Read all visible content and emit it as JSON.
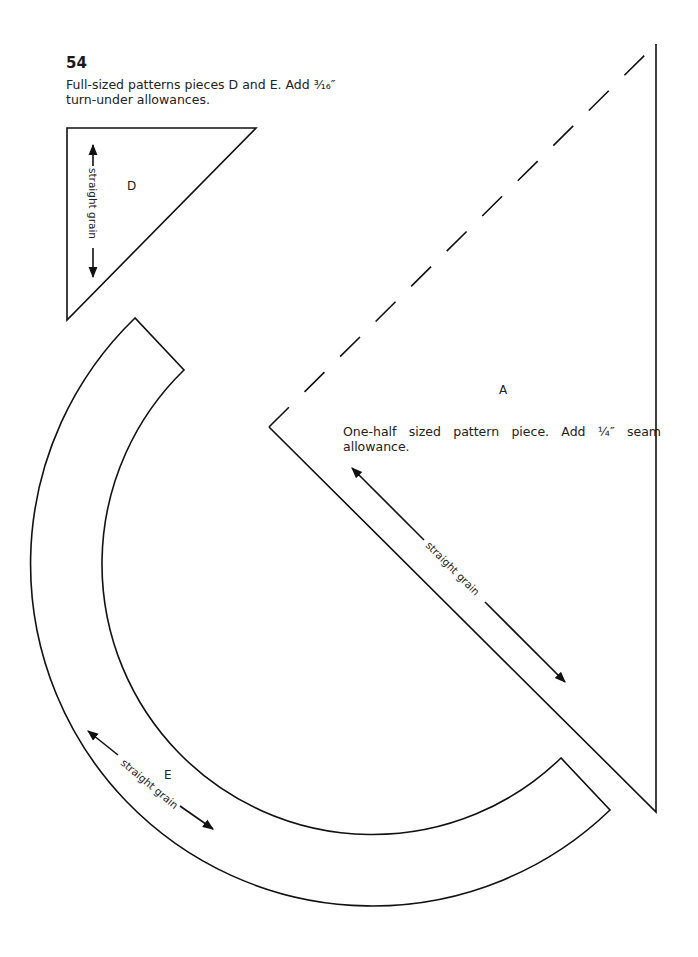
{
  "page": {
    "number": "54"
  },
  "captions": {
    "pieces_de": "Full-sized patterns pieces D and E. Add ³⁄₁₆″ turn-under allowances.",
    "piece_a": "One-half sized pattern piece. Add ¼″ seam allowance."
  },
  "pieces": {
    "d": {
      "label": "D",
      "grain_label": "straight grain"
    },
    "a": {
      "label": "A",
      "grain_label": "straight grain"
    },
    "e": {
      "label": "E",
      "grain_label": "straight grain"
    }
  },
  "colors": {
    "line": "#111111",
    "background": "#ffffff"
  }
}
